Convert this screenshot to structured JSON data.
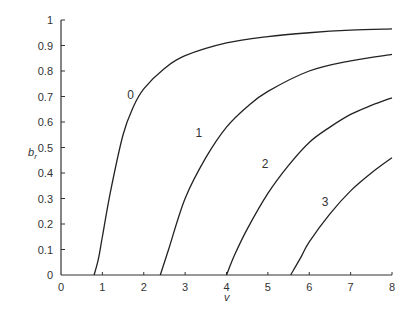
{
  "chart_data": {
    "type": "line",
    "title": "",
    "xlabel": "v",
    "ylabel": "b_r",
    "xlim": [
      0,
      8
    ],
    "ylim": [
      0,
      1
    ],
    "x_ticks": [
      "0",
      "1",
      "2",
      "3",
      "4",
      "5",
      "6",
      "7",
      "8"
    ],
    "y_ticks": [
      "0",
      "0.1",
      "0.2",
      "0.3",
      "0.4",
      "0.5",
      "0.6",
      "0.7",
      "0.8",
      "0.9",
      "1"
    ],
    "grid": false,
    "legend": "inline curve labels",
    "series": [
      {
        "name": "0",
        "label_pos": [
          1.6,
          0.69
        ],
        "points": [
          [
            0.8,
            0
          ],
          [
            0.9,
            0.06
          ],
          [
            1.0,
            0.15
          ],
          [
            1.2,
            0.33
          ],
          [
            1.5,
            0.55
          ],
          [
            1.75,
            0.66
          ],
          [
            2.0,
            0.73
          ],
          [
            2.5,
            0.81
          ],
          [
            3.0,
            0.86
          ],
          [
            4.0,
            0.91
          ],
          [
            5.0,
            0.935
          ],
          [
            6.0,
            0.95
          ],
          [
            7.0,
            0.96
          ],
          [
            8.0,
            0.965
          ]
        ]
      },
      {
        "name": "1",
        "label_pos": [
          3.25,
          0.54
        ],
        "points": [
          [
            2.4,
            0
          ],
          [
            2.6,
            0.1
          ],
          [
            3.0,
            0.3
          ],
          [
            3.5,
            0.46
          ],
          [
            4.0,
            0.58
          ],
          [
            4.5,
            0.66
          ],
          [
            5.0,
            0.72
          ],
          [
            6.0,
            0.8
          ],
          [
            7.0,
            0.84
          ],
          [
            8.0,
            0.865
          ]
        ]
      },
      {
        "name": "2",
        "label_pos": [
          4.85,
          0.42
        ],
        "points": [
          [
            4.0,
            0
          ],
          [
            4.2,
            0.08
          ],
          [
            4.5,
            0.18
          ],
          [
            5.0,
            0.32
          ],
          [
            5.5,
            0.43
          ],
          [
            6.0,
            0.52
          ],
          [
            6.5,
            0.58
          ],
          [
            7.0,
            0.63
          ],
          [
            7.5,
            0.665
          ],
          [
            8.0,
            0.695
          ]
        ]
      },
      {
        "name": "3",
        "label_pos": [
          6.3,
          0.27
        ],
        "points": [
          [
            5.55,
            0
          ],
          [
            5.8,
            0.07
          ],
          [
            6.0,
            0.13
          ],
          [
            6.5,
            0.24
          ],
          [
            7.0,
            0.33
          ],
          [
            7.5,
            0.4
          ],
          [
            8.0,
            0.46
          ]
        ]
      }
    ]
  }
}
